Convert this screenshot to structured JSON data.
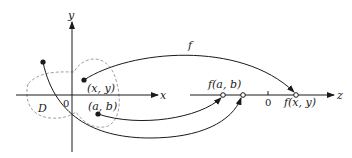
{
  "diagram": {
    "domain_label": "D",
    "function_label": "f",
    "xy_plane": {
      "x_axis_label": "x",
      "y_axis_label": "y",
      "origin_label": "0",
      "point_xy_label": "(x, y)",
      "point_ab_label": "(a, b)"
    },
    "z_line": {
      "axis_label": "z",
      "origin_label": "0",
      "fab_label": "f(a, b)",
      "fxy_label": "f(x, y)"
    },
    "colors": {
      "ink": "#1a1a1a",
      "dashed": "#888888"
    }
  }
}
